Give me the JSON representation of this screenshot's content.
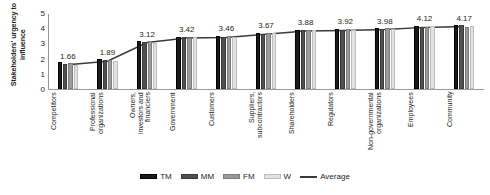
{
  "chart_data": {
    "type": "bar",
    "title": "",
    "subtitle": "",
    "xlabel": "",
    "ylabel": "Stakeholders' urgency to influence",
    "ylim": [
      0,
      5
    ],
    "yticks": [
      5,
      4,
      3,
      2,
      1,
      0
    ],
    "grid": false,
    "legend_position": "bottom",
    "categories": [
      "Competitors",
      "Professional organizations",
      "Owners, investors and financiers",
      "Government",
      "Customers",
      "Suppliers, subcontractors",
      "Shareholders",
      "Regulators",
      "Non-governmental organizations",
      "Employees",
      "Community"
    ],
    "category_lines": [
      [
        "Competitors"
      ],
      [
        "Professional",
        "organizations"
      ],
      [
        "Owners,",
        "investors and",
        "financiers"
      ],
      [
        "Government"
      ],
      [
        "Customers"
      ],
      [
        "Suppliers,",
        "subcontractors"
      ],
      [
        "Shareholders"
      ],
      [
        "Regulators"
      ],
      [
        "Non-governmental",
        "organizations"
      ],
      [
        "Employees"
      ],
      [
        "Community"
      ]
    ],
    "series": [
      {
        "name": "TM",
        "color": "#1a1a1a",
        "values": [
          1.78,
          1.95,
          3.15,
          3.4,
          3.5,
          3.7,
          3.85,
          3.95,
          4.0,
          4.15,
          4.2
        ]
      },
      {
        "name": "MM",
        "color": "#4f4f4f",
        "values": [
          1.62,
          1.88,
          3.1,
          3.45,
          3.42,
          3.62,
          3.9,
          3.88,
          3.95,
          4.1,
          4.22
        ]
      },
      {
        "name": "FM",
        "color": "#9b9b9b",
        "values": [
          1.7,
          1.92,
          3.18,
          3.38,
          3.52,
          3.68,
          3.86,
          3.94,
          4.02,
          4.08,
          4.1
        ]
      },
      {
        "name": "W",
        "color": "#e2e2e2",
        "values": [
          1.55,
          1.82,
          3.05,
          3.45,
          3.4,
          3.68,
          3.9,
          3.9,
          3.95,
          4.15,
          4.15
        ]
      }
    ],
    "average_series": {
      "name": "Average",
      "color": "#3a3a3a",
      "values": [
        1.66,
        1.89,
        3.12,
        3.42,
        3.46,
        3.67,
        3.88,
        3.92,
        3.98,
        4.12,
        4.17
      ]
    },
    "data_labels": [
      "1.66",
      "1.89",
      "3.12",
      "3.42",
      "3.46",
      "3.67",
      "3.88",
      "3.92",
      "3.98",
      "4.12",
      "4.17"
    ],
    "legend": [
      {
        "label": "TM",
        "swatch": "tm"
      },
      {
        "label": "MM",
        "swatch": "mm"
      },
      {
        "label": "FM",
        "swatch": "fm"
      },
      {
        "label": "W",
        "swatch": "w"
      },
      {
        "label": "Average",
        "swatch": "line"
      }
    ]
  }
}
